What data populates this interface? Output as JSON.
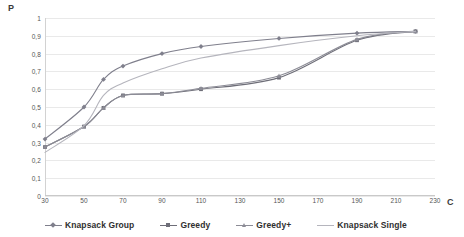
{
  "chart": {
    "axis_label_y": "P",
    "axis_label_x": "C"
  },
  "chart_data": {
    "type": "line",
    "title": "",
    "xlabel": "C",
    "ylabel": "P",
    "xlim": [
      30,
      230
    ],
    "ylim": [
      0,
      1
    ],
    "grid": true,
    "legend_position": "bottom",
    "xticks": [
      "30",
      "50",
      "70",
      "90",
      "110",
      "130",
      "150",
      "170",
      "190",
      "210",
      "230"
    ],
    "xtick_values": [
      30,
      50,
      70,
      90,
      110,
      130,
      150,
      170,
      190,
      210,
      230
    ],
    "yticks": [
      "0",
      "0,1",
      "0,2",
      "0,3",
      "0,4",
      "0,5",
      "0,6",
      "0,7",
      "0,8",
      "0,9",
      "1"
    ],
    "ytick_values": [
      0,
      0.1,
      0.2,
      0.3,
      0.4,
      0.5,
      0.6,
      0.7,
      0.8,
      0.9,
      1
    ],
    "x": [
      30,
      50,
      60,
      70,
      90,
      110,
      150,
      190,
      220
    ],
    "series": [
      {
        "name": "Knapsack Group",
        "color": "#7f7f8c",
        "marker": "diamond",
        "values": [
          0.32,
          0.5,
          0.655,
          0.73,
          0.8,
          0.84,
          0.885,
          0.915,
          0.925
        ]
      },
      {
        "name": "Greedy",
        "color": "#6e6e78",
        "marker": "square",
        "values": [
          0.275,
          0.39,
          0.495,
          0.565,
          0.575,
          0.6,
          0.665,
          0.875,
          0.925
        ]
      },
      {
        "name": "Greedy+",
        "color": "#8c8c96",
        "marker": "triangle",
        "values": [
          0.275,
          0.39,
          0.495,
          0.565,
          0.575,
          0.605,
          0.675,
          0.88,
          0.925
        ]
      },
      {
        "name": "Knapsack Single",
        "color": "#b5b5bd",
        "marker": "line",
        "values": [
          0.245,
          0.395,
          0.565,
          0.635,
          0.715,
          0.775,
          0.845,
          0.9,
          0.925
        ]
      }
    ]
  }
}
